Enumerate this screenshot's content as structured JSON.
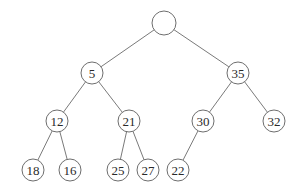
{
  "diagram": {
    "type": "binary-tree",
    "style": {
      "edge_color": "#7a7a7a",
      "node_stroke": "#6e6e6e",
      "node_fill": "#ffffff",
      "text_color": "#2a2a2a"
    },
    "nodes": [
      {
        "id": "root",
        "label": "",
        "x": 164,
        "y": 23,
        "r": 12
      },
      {
        "id": "n5",
        "label": "5",
        "x": 92,
        "y": 73,
        "r": 11
      },
      {
        "id": "n35",
        "label": "35",
        "x": 238,
        "y": 73,
        "r": 11
      },
      {
        "id": "n12",
        "label": "12",
        "x": 57,
        "y": 121,
        "r": 11
      },
      {
        "id": "n21",
        "label": "21",
        "x": 129,
        "y": 121,
        "r": 11
      },
      {
        "id": "n30",
        "label": "30",
        "x": 203,
        "y": 121,
        "r": 11
      },
      {
        "id": "n32",
        "label": "32",
        "x": 274,
        "y": 121,
        "r": 11
      },
      {
        "id": "n18",
        "label": "18",
        "x": 33,
        "y": 170,
        "r": 11
      },
      {
        "id": "n16",
        "label": "16",
        "x": 70,
        "y": 170,
        "r": 11
      },
      {
        "id": "n25",
        "label": "25",
        "x": 118,
        "y": 170,
        "r": 11
      },
      {
        "id": "n27",
        "label": "27",
        "x": 148,
        "y": 170,
        "r": 11
      },
      {
        "id": "n22",
        "label": "22",
        "x": 178,
        "y": 170,
        "r": 11
      }
    ],
    "edges": [
      {
        "from": "root",
        "to": "n5"
      },
      {
        "from": "root",
        "to": "n35"
      },
      {
        "from": "n5",
        "to": "n12"
      },
      {
        "from": "n5",
        "to": "n21"
      },
      {
        "from": "n35",
        "to": "n30"
      },
      {
        "from": "n35",
        "to": "n32"
      },
      {
        "from": "n12",
        "to": "n18"
      },
      {
        "from": "n12",
        "to": "n16"
      },
      {
        "from": "n21",
        "to": "n25"
      },
      {
        "from": "n21",
        "to": "n27"
      },
      {
        "from": "n30",
        "to": "n22"
      }
    ]
  }
}
